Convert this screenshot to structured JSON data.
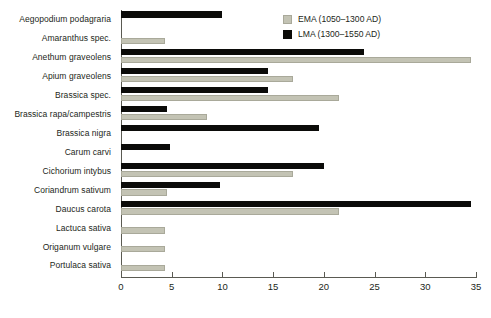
{
  "chart_data": {
    "type": "bar",
    "orientation": "horizontal",
    "title": "",
    "subtitle": "",
    "xlabel": "",
    "ylabel": "",
    "xlim": [
      0,
      35
    ],
    "xticks": [
      0,
      5,
      10,
      15,
      20,
      25,
      30,
      35
    ],
    "xtick_labels": [
      "0",
      "5",
      "10",
      "15",
      "20",
      "25",
      "30",
      "35"
    ],
    "grid": false,
    "legend_position": "top-right",
    "categories": [
      "Aegopodium podagraria",
      "Amaranthus spec.",
      "Anethum graveolens",
      "Apium graveolens",
      "Brassica spec.",
      "Brassica rapa/campestris",
      "Brassica nigra",
      "Carum carvi",
      "Cichorium intybus",
      "Coriandrum sativum",
      "Daucus carota",
      "Lactuca sativa",
      "Origanum vulgare",
      "Portulaca sativa"
    ],
    "series": [
      {
        "name": "EMA (1050–1300 AD)",
        "key": "ema",
        "color": "#c3c3b4",
        "values": [
          0,
          4.3,
          34.5,
          17,
          21.5,
          8.5,
          0,
          0,
          17,
          4.5,
          21.5,
          4.3,
          4.3,
          4.3
        ]
      },
      {
        "name": "LMA (1300–1550 AD)",
        "key": "lma",
        "color": "#0b0b09",
        "values": [
          10,
          0,
          24,
          14.5,
          14.5,
          4.5,
          19.5,
          4.8,
          20,
          9.8,
          34.5,
          0,
          0,
          0
        ]
      }
    ]
  },
  "legend": {
    "items": [
      {
        "label": "EMA (1050–1300 AD)",
        "swatch": "ema"
      },
      {
        "label": "LMA (1300–1550 AD)",
        "swatch": "lma"
      }
    ]
  },
  "colors": {
    "ema": "#c3c3b4",
    "ema_border": "#a9a99a",
    "lma": "#0b0b09",
    "axis": "#5a5a52",
    "text": "#231f20",
    "background": "#ffffff"
  }
}
